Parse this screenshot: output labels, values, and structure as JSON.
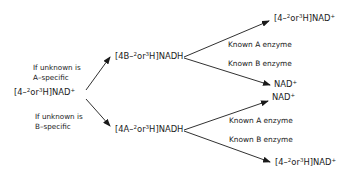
{
  "diagram": {
    "start": {
      "pre": "[4–",
      "sup1": "2",
      "mid": "or",
      "sup2": "3",
      "post": "H]NAD",
      "charge": "+"
    },
    "condition_a": {
      "line1": "If unknown is",
      "line2": "A–specific"
    },
    "condition_b": {
      "line1": "If unknown is",
      "line2": "B–specific"
    },
    "intermediate_a": {
      "pre": "[4B–",
      "sup1": "2",
      "mid": "or",
      "sup2": "3",
      "post": "H]NADH"
    },
    "intermediate_b": {
      "pre": "[4A–",
      "sup1": "2",
      "mid": "or",
      "sup2": "3",
      "post": "H]NADH"
    },
    "top_branch": {
      "product_a": {
        "pre": "[4–",
        "sup1": "2",
        "mid": "or",
        "sup2": "3",
        "post": "H]NAD",
        "charge": "+"
      },
      "enzyme_a": "Known A enzyme",
      "enzyme_b": "Known B enzyme",
      "product_b": {
        "text": "NAD",
        "charge": "+"
      }
    },
    "bottom_branch": {
      "product_a": {
        "text": "NAD",
        "charge": "+"
      },
      "enzyme_a": "Known A enzyme",
      "enzyme_b": "Known B enzyme",
      "product_b": {
        "pre": "[4–",
        "sup1": "2",
        "mid": "or",
        "sup2": "3",
        "post": "H]NAD",
        "charge": "+"
      }
    }
  }
}
